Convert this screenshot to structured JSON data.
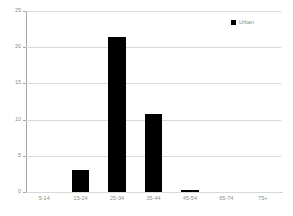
{
  "chart_data": {
    "type": "bar",
    "title": "",
    "xlabel": "",
    "ylabel": "",
    "categories": [
      "5-14",
      "15-24",
      "25-34",
      "35-44",
      "45-54",
      "65-74",
      "75+"
    ],
    "values": [
      0,
      3.1,
      21.4,
      10.8,
      0.3,
      0,
      0
    ],
    "series": [
      {
        "name": "Urban",
        "values": [
          0,
          3.1,
          21.4,
          10.8,
          0.3,
          0,
          0
        ],
        "color": "#000000"
      }
    ],
    "ylim": [
      0,
      25
    ],
    "yticks": [
      0,
      5,
      10,
      15,
      20,
      25
    ],
    "ytick_labels": [
      "0",
      "5",
      "10",
      "15",
      "20",
      "25"
    ],
    "grid": true,
    "legend_position": "top-right"
  },
  "legend": {
    "entries": [
      {
        "label": "Urban",
        "color": "#000000",
        "marker": "square"
      }
    ]
  },
  "colors": {
    "bar": "#000000",
    "gridline": "#d9d9d9",
    "axis": "#a6a6a6",
    "tick_text": "#8c8c8c",
    "background": "#ffffff"
  }
}
